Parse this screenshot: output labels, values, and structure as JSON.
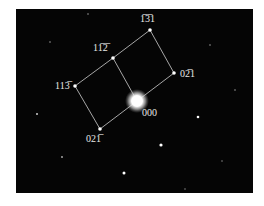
{
  "figure": {
    "type": "electron diffraction pattern",
    "background": "#050505",
    "spot_color": "#ffffff",
    "line_color": "#cfcfcf",
    "central_spot": {
      "label": "000",
      "x": 137,
      "y": 101
    },
    "indexed_spots": [
      {
        "id": "s131",
        "label": "1̅3̅1",
        "x": 150,
        "y": 30
      },
      {
        "id": "s112",
        "label": "11̅2̅",
        "x": 113,
        "y": 58
      },
      {
        "id": "s113",
        "label": "113̅",
        "x": 75,
        "y": 86
      },
      {
        "id": "s021",
        "label": "02̅1",
        "x": 174,
        "y": 73
      },
      {
        "id": "s0m21",
        "label": "021̅",
        "x": 100,
        "y": 129
      }
    ],
    "labels": {
      "l131": "1̅3̅1",
      "l112": "11̅2̅",
      "l113": "113̅",
      "l021": "02̅1",
      "l000": "000",
      "l0m21": "021̅"
    },
    "caption": ""
  }
}
